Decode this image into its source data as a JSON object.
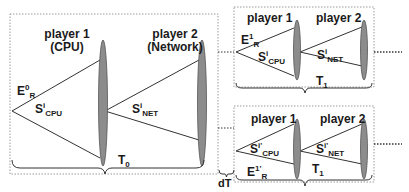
{
  "diagram": {
    "main_block": {
      "player1": {
        "title": "player 1",
        "subtitle": "(CPU)"
      },
      "player2": {
        "title": "player 2",
        "subtitle": "(Network)"
      },
      "E_label": {
        "base": "E",
        "sup": "0",
        "sub": "R"
      },
      "S_cpu": {
        "base": "S",
        "sup": "i",
        "sub": "CPU"
      },
      "S_net": {
        "base": "S",
        "sup": "i",
        "sub": "NET"
      },
      "period": {
        "base": "T",
        "sub": "0"
      }
    },
    "top_block": {
      "player1": {
        "title": "player 1"
      },
      "player2": {
        "title": "player 2"
      },
      "E_label": {
        "base": "E",
        "sup": "1",
        "sub": "R"
      },
      "S_cpu": {
        "base": "S",
        "sup": "i",
        "sub": "CPU"
      },
      "S_net": {
        "base": "S",
        "sup": "i",
        "sub": "NET"
      },
      "period": {
        "base": "T",
        "sub": "1"
      }
    },
    "bottom_block": {
      "player1": {
        "title": "player 1"
      },
      "player2": {
        "title": "player 2"
      },
      "E_label": {
        "base": "E",
        "sup": "1'",
        "sub": "R"
      },
      "S_cpu": {
        "base": "S",
        "sup": "i'",
        "sub": "CPU"
      },
      "S_net": {
        "base": "S",
        "sup": "i'",
        "sub": "NET"
      },
      "period": {
        "base": "T",
        "sub": "1"
      }
    },
    "offset_label": "dT",
    "colors": {
      "ellipse_fill": "#8c8c8c",
      "ellipse_stroke": "#555555",
      "line": "#333333",
      "dotted_border": "#9a9a9a"
    }
  }
}
